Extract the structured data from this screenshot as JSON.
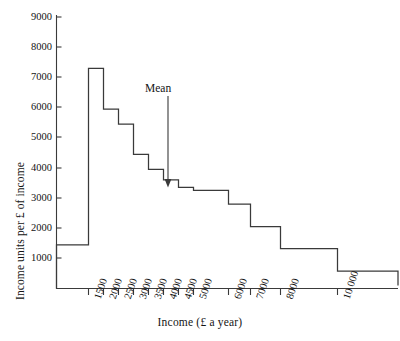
{
  "chart_data": {
    "type": "bar",
    "title": "",
    "xlabel": "Income (£ a year)",
    "ylabel": "Income units per £ of income",
    "grid": false,
    "legend": null,
    "ylim": [
      0,
      9000
    ],
    "ytick_labels": [
      "9000",
      "8000",
      "7000",
      "6000",
      "5000",
      "4000",
      "3000",
      "2000",
      "1000"
    ],
    "ytick_values": [
      9000,
      8000,
      7000,
      6000,
      5000,
      4000,
      3000,
      2000,
      1000
    ],
    "xtick_labels": [
      "1500",
      "2000",
      "2500",
      "3000",
      "3500",
      "4000",
      "4500",
      "5000",
      "6000",
      "7000",
      "8000",
      "10 000"
    ],
    "xtick_values": [
      1500,
      2000,
      2500,
      3000,
      3500,
      4000,
      4500,
      5000,
      6000,
      7000,
      8000,
      10000
    ],
    "bin_edges": [
      1000,
      1500,
      2000,
      2500,
      3000,
      3500,
      4000,
      4500,
      5000,
      6000,
      7000,
      8000,
      10000,
      12000
    ],
    "categories": [
      "under 1500",
      "1500-2000",
      "2000-2500",
      "2500-3000",
      "3000-3500",
      "3500-4000",
      "4000-4500",
      "4500-5000",
      "5000-6000",
      "6000-7000",
      "7000-8000",
      "8000-10 000",
      "over 10 000"
    ],
    "values": [
      1450,
      7300,
      5950,
      5450,
      4450,
      3950,
      3600,
      3350,
      3250,
      2800,
      2050,
      1320,
      580
    ],
    "tail_value": 100,
    "annotations": [
      {
        "label": "Mean",
        "x_value": 4150,
        "y_value": 3350,
        "marker": "down-arrow"
      }
    ]
  },
  "annotation": {
    "mean_label": "Mean"
  },
  "axes": {
    "x_title": "Income (£ a year)",
    "y_title": "Income units per £ of income"
  }
}
